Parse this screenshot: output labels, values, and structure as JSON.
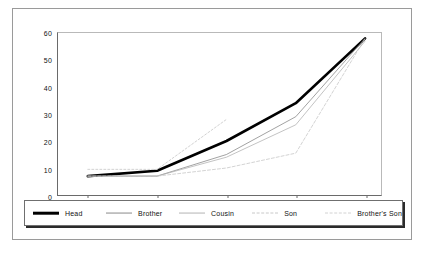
{
  "chart_data": {
    "type": "line",
    "title": "",
    "subtitle": "",
    "xlabel": "",
    "ylabel": "",
    "categories": [
      "21-30",
      "31-40",
      "41-50",
      "51-60",
      "61-70"
    ],
    "x_tick_labels": [
      "21-30",
      "31-40",
      "41-50",
      "51-60",
      "61-70"
    ],
    "y_tick_labels": [
      "0",
      "10",
      "20",
      "30",
      "40",
      "50",
      "60"
    ],
    "y_ticks": [
      0,
      10,
      20,
      30,
      40,
      50,
      60
    ],
    "ylim": [
      0,
      60
    ],
    "grid": false,
    "legend_position": "bottom",
    "series": [
      {
        "name": "Head",
        "values": [
          7,
          9,
          20,
          34,
          58
        ],
        "color": "#000000",
        "width": 2.6,
        "dash": "none"
      },
      {
        "name": "Brother",
        "values": [
          7,
          7,
          15,
          29,
          58
        ],
        "color": "#8a8a8a",
        "width": 0.8,
        "dash": "none"
      },
      {
        "name": "Cousin",
        "values": [
          7,
          7,
          14,
          26,
          57
        ],
        "color": "#b4b4b4",
        "width": 0.8,
        "dash": "none"
      },
      {
        "name": "Son",
        "values": [
          7,
          7,
          10,
          15.5,
          58
        ],
        "color": "#c8c8c8",
        "width": 0.8,
        "dash": "3,2"
      },
      {
        "name": "Brother's Son",
        "values": [
          9.5,
          9.5,
          28,
          null,
          null
        ],
        "color": "#d2d2d2",
        "width": 1.0,
        "dash": "2,2"
      }
    ],
    "legend": [
      {
        "label": "Head",
        "color": "#000000",
        "width": 2.6,
        "dash": "none"
      },
      {
        "label": "Brother",
        "color": "#8a8a8a",
        "width": 0.9,
        "dash": "none"
      },
      {
        "label": "Cousin",
        "color": "#b4b4b4",
        "width": 0.9,
        "dash": "none"
      },
      {
        "label": "Son",
        "color": "#c8c8c8",
        "width": 0.9,
        "dash": "3,2"
      },
      {
        "label": "Brother's Son",
        "color": "#d2d2d2",
        "width": 1.0,
        "dash": "2,2"
      }
    ]
  }
}
